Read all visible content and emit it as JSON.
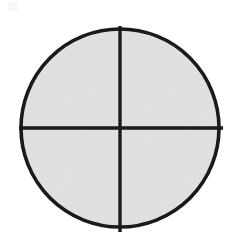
{
  "figure": {
    "type": "diagram",
    "canvas": {
      "width": 240,
      "height": 239,
      "background_color": "#ffffff"
    },
    "shapes": {
      "circle": {
        "name": "outer-circle",
        "center_x": 120,
        "center_y": 128,
        "radius": 99,
        "stroke_color": "#1a1a1a",
        "stroke_width": 3.6,
        "fill_color": "#e2e2e2"
      },
      "vertical_line": {
        "name": "vertical-divider",
        "x": 120,
        "y_start": 26,
        "y_end": 232,
        "stroke_color": "#1a1a1a",
        "stroke_width": 3.4
      },
      "horizontal_line": {
        "name": "horizontal-divider",
        "y": 128,
        "x_start": 19,
        "x_end": 223,
        "stroke_color": "#1a1a1a",
        "stroke_width": 3.4
      }
    },
    "quadrants": [
      {
        "name": "upper-left-quadrant",
        "fill_color": "#e2e2e2"
      },
      {
        "name": "upper-right-quadrant",
        "fill_color": "#e2e2e2"
      },
      {
        "name": "lower-left-quadrant",
        "fill_color": "#e2e2e2"
      },
      {
        "name": "lower-right-quadrant",
        "fill_color": "#e2e2e2"
      }
    ],
    "artifact": {
      "name": "scan-artifact",
      "x": 8,
      "y": 2,
      "width": 10,
      "height": 9,
      "fill_color": "#f7f7f7"
    }
  }
}
